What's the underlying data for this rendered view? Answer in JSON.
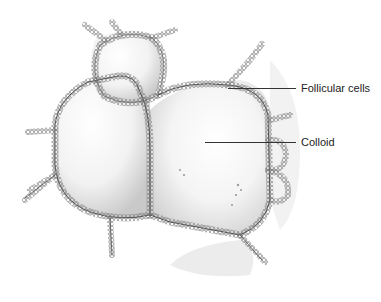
{
  "figure": {
    "labels": [
      {
        "text": "Follicular cells",
        "x": 301,
        "y": 82
      },
      {
        "text": "Colloid",
        "x": 301,
        "y": 136
      }
    ],
    "leaders": [
      {
        "x1": 228,
        "x2": 296,
        "y": 88
      },
      {
        "x1": 205,
        "x2": 296,
        "y": 142
      }
    ],
    "colors": {
      "cell_border": "#8a8a8a",
      "cell_dark": "#3a3a3a",
      "colloid_shade": "#d8d8d8",
      "background": "#ffffff"
    }
  }
}
